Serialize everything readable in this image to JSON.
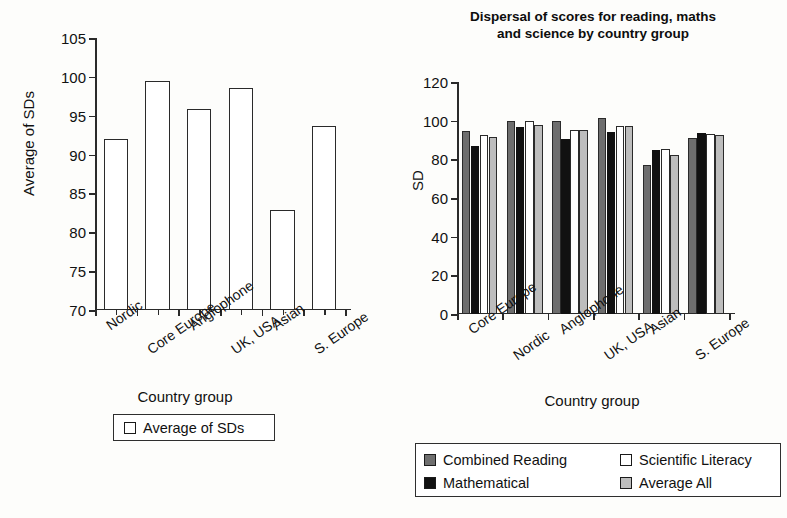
{
  "chart_data": [
    {
      "id": "left",
      "type": "bar",
      "title": "",
      "xlabel": "Country group",
      "ylabel": "Average of SDs",
      "ylim": [
        70,
        105
      ],
      "yticks": [
        70,
        75,
        80,
        85,
        90,
        95,
        100,
        105
      ],
      "grid": false,
      "legend_position": "below",
      "categories": [
        "Nordic",
        "Core Europe",
        "Anglophone",
        "UK, USA",
        "Asian",
        "S. Europe"
      ],
      "series": [
        {
          "name": "Average of SDs",
          "color": "#ffffff",
          "values": [
            92.0,
            99.5,
            95.9,
            98.6,
            82.9,
            93.7
          ]
        }
      ],
      "legend": [
        {
          "label": "Average of SDs",
          "color": "#ffffff"
        }
      ]
    },
    {
      "id": "right",
      "type": "bar",
      "title": "Dispersal of scores for reading, maths and science by country group",
      "title_lines": [
        "Dispersal of scores for reading, maths",
        "and science by country group"
      ],
      "xlabel": "Country group",
      "ylabel": "SD",
      "ylim": [
        0,
        120
      ],
      "yticks": [
        0,
        20,
        40,
        60,
        80,
        100,
        120
      ],
      "grid": false,
      "legend_position": "below",
      "categories": [
        "Core Europe",
        "Nordic",
        "Anglophone",
        "UK, USA",
        "Asian",
        "S. Europe"
      ],
      "series": [
        {
          "name": "Combined Reading",
          "color": "#6e6e6e",
          "values": [
            94.5,
            100.0,
            99.6,
            101.5,
            77.0,
            91.0
          ]
        },
        {
          "name": "Mathematical",
          "color": "#111111",
          "values": [
            87.0,
            96.8,
            90.5,
            94.2,
            85.0,
            93.5
          ]
        },
        {
          "name": "Scientific Literacy",
          "color": "#ffffff",
          "values": [
            92.8,
            100.0,
            95.2,
            97.5,
            85.3,
            93.0
          ]
        },
        {
          "name": "Average All",
          "color": "#bdbdbd",
          "values": [
            91.8,
            98.0,
            95.0,
            97.5,
            82.5,
            92.5
          ]
        }
      ],
      "legend": [
        {
          "label": "Combined Reading",
          "color": "#6e6e6e"
        },
        {
          "label": "Scientific Literacy",
          "color": "#ffffff"
        },
        {
          "label": "Mathematical",
          "color": "#111111"
        },
        {
          "label": "Average All",
          "color": "#bdbdbd"
        }
      ]
    }
  ]
}
